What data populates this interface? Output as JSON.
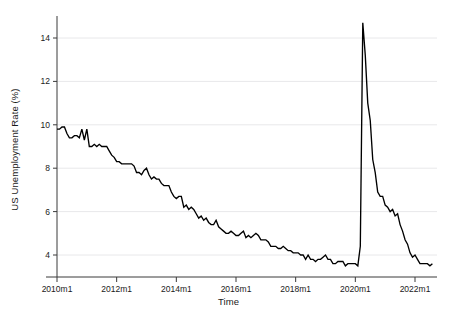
{
  "chart_data": {
    "type": "line",
    "title": "",
    "xlabel": "Time",
    "ylabel": "US Unemployment Rate (%)",
    "xlim": [
      "2010m1",
      "2022m8"
    ],
    "ylim": [
      3.2,
      14.9
    ],
    "grid": "horizontal",
    "legend": "none",
    "line_color": "#000000",
    "grid_color": "#e8e8ea",
    "axis_color": "#3a3a3a",
    "background": "#ffffff",
    "x_tick_labels": [
      "2010m1",
      "2012m1",
      "2014m1",
      "2016m1",
      "2018m1",
      "2020m1",
      "2022m1"
    ],
    "x_tick_values": [
      2010.0,
      2012.0,
      2014.0,
      2016.0,
      2018.0,
      2020.0,
      2022.0
    ],
    "y_tick_labels": [
      "4",
      "6",
      "8",
      "10",
      "12",
      "14"
    ],
    "y_tick_values": [
      4,
      6,
      8,
      10,
      12,
      14
    ],
    "series": [
      {
        "name": "US Unemployment Rate",
        "x_start": 2010.0,
        "x_step": 0.0833333,
        "values": [
          9.8,
          9.8,
          9.9,
          9.9,
          9.6,
          9.4,
          9.4,
          9.5,
          9.5,
          9.4,
          9.8,
          9.3,
          9.8,
          9.0,
          9.0,
          9.1,
          9.0,
          9.1,
          9.0,
          9.0,
          9.0,
          8.8,
          8.6,
          8.5,
          8.3,
          8.3,
          8.2,
          8.2,
          8.2,
          8.2,
          8.2,
          8.1,
          7.8,
          7.8,
          7.7,
          7.9,
          8.0,
          7.7,
          7.5,
          7.6,
          7.5,
          7.5,
          7.3,
          7.2,
          7.2,
          7.2,
          6.9,
          6.7,
          6.6,
          6.7,
          6.7,
          6.2,
          6.3,
          6.1,
          6.2,
          6.1,
          5.9,
          5.7,
          5.8,
          5.6,
          5.7,
          5.5,
          5.4,
          5.4,
          5.6,
          5.3,
          5.2,
          5.1,
          5.0,
          5.0,
          5.1,
          5.0,
          4.9,
          4.9,
          5.0,
          5.1,
          4.8,
          4.9,
          4.8,
          4.9,
          5.0,
          4.9,
          4.7,
          4.7,
          4.7,
          4.6,
          4.4,
          4.4,
          4.4,
          4.3,
          4.3,
          4.4,
          4.3,
          4.2,
          4.2,
          4.1,
          4.1,
          4.1,
          4.0,
          4.0,
          3.8,
          4.0,
          3.8,
          3.8,
          3.7,
          3.8,
          3.8,
          3.9,
          4.0,
          3.8,
          3.8,
          3.6,
          3.6,
          3.7,
          3.7,
          3.7,
          3.5,
          3.6,
          3.6,
          3.6,
          3.6,
          3.5,
          4.4,
          14.7,
          13.2,
          11.0,
          10.2,
          8.4,
          7.8,
          6.9,
          6.7,
          6.7,
          6.3,
          6.2,
          6.0,
          6.1,
          5.8,
          5.9,
          5.4,
          5.1,
          4.7,
          4.5,
          4.1,
          3.9,
          4.0,
          3.8,
          3.6,
          3.6,
          3.6,
          3.6,
          3.5,
          3.6
        ]
      }
    ]
  },
  "axis_titles": {
    "x": "Time",
    "y": "US Unemployment Rate (%)"
  }
}
